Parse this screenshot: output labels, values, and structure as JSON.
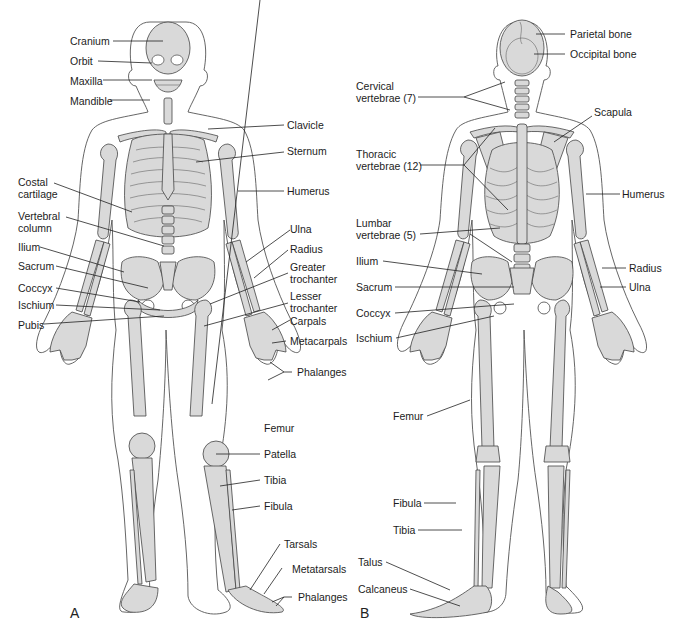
{
  "figure": {
    "panels": [
      {
        "letter": "A",
        "view": "anterior",
        "labels": {
          "cranium": "Cranium",
          "orbit": "Orbit",
          "maxilla": "Maxilla",
          "mandible": "Mandible",
          "clavicle": "Clavicle",
          "sternum": "Sternum",
          "costal_cartilage": "Costal cartilage",
          "humerus": "Humerus",
          "vertebral_column": "Vertebral column",
          "ulna": "Ulna",
          "radius": "Radius",
          "ilium": "Ilium",
          "greater_trochanter": "Greater trochanter",
          "sacrum": "Sacrum",
          "coccyx": "Coccyx",
          "lesser_trochanter": "Lesser trochanter",
          "ischium": "Ischium",
          "carpals": "Carpals",
          "pubis": "Pubis",
          "metacarpals": "Metacarpals",
          "phalanges_hand": "Phalanges",
          "femur": "Femur",
          "patella": "Patella",
          "tibia": "Tibia",
          "fibula": "Fibula",
          "tarsals": "Tarsals",
          "metatarsals": "Metatarsals",
          "phalanges_foot": "Phalanges"
        }
      },
      {
        "letter": "B",
        "view": "posterior",
        "labels": {
          "parietal_bone": "Parietal bone",
          "occipital_bone": "Occipital bone",
          "cervical_vertebrae": "Cervical vertebrae (7)",
          "scapula": "Scapula",
          "thoracic_vertebrae": "Thoracic vertebrae (12)",
          "humerus": "Humerus",
          "lumbar_vertebrae": "Lumbar vertebrae (5)",
          "ilium": "Ilium",
          "radius": "Radius",
          "sacrum": "Sacrum",
          "ulna": "Ulna",
          "coccyx": "Coccyx",
          "ischium": "Ischium",
          "femur": "Femur",
          "fibula": "Fibula",
          "tibia": "Tibia",
          "talus": "Talus",
          "calcaneus": "Calcaneus"
        }
      }
    ],
    "colors": {
      "bone_fill": "#d9d9d9",
      "outline": "#444444",
      "background": "#ffffff"
    }
  }
}
